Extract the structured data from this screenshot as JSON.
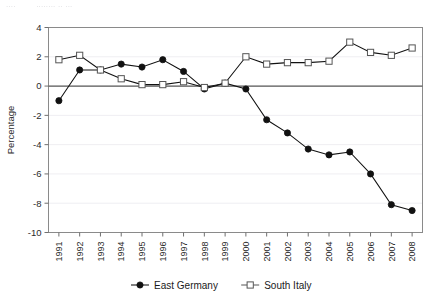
{
  "caption": {
    "fragment_left": "....",
    "fragment_right": "........ .. ..."
  },
  "chart_data": {
    "type": "line",
    "title": "",
    "xlabel": "",
    "ylabel": "Percentage",
    "ylim": [
      -10,
      4
    ],
    "yticks": [
      4,
      2,
      0,
      -2,
      -4,
      -6,
      -8,
      -10
    ],
    "ytick_labels": [
      "4",
      "2",
      "0",
      "-2",
      "-4",
      "-6",
      "-8",
      "-10"
    ],
    "grid": true,
    "legend_position": "bottom",
    "categories": [
      "1991",
      "1992",
      "1993",
      "1994",
      "1995",
      "1996",
      "1997",
      "1998",
      "1999",
      "2000",
      "2001",
      "2002",
      "2003",
      "2004",
      "2005",
      "2006",
      "2007",
      "2008"
    ],
    "series": [
      {
        "name": "East Germany",
        "marker": "filled-circle",
        "values": [
          -1.0,
          1.1,
          1.1,
          1.5,
          1.3,
          1.8,
          1.0,
          -0.2,
          0.2,
          -0.2,
          -2.3,
          -3.2,
          -4.3,
          -4.7,
          -4.5,
          -6.0,
          -8.1,
          -8.5
        ]
      },
      {
        "name": "South Italy",
        "marker": "open-square",
        "values": [
          1.8,
          2.1,
          1.1,
          0.5,
          0.1,
          0.1,
          0.3,
          -0.1,
          0.2,
          2.0,
          1.5,
          1.6,
          1.6,
          1.7,
          3.0,
          2.3,
          2.1,
          2.6
        ]
      }
    ],
    "colors": {
      "series_line": "#111111",
      "open_marker_stroke": "#555555",
      "grid": "#efeef2",
      "axis": "#6f6f6f",
      "zero_line": "#585858"
    }
  }
}
